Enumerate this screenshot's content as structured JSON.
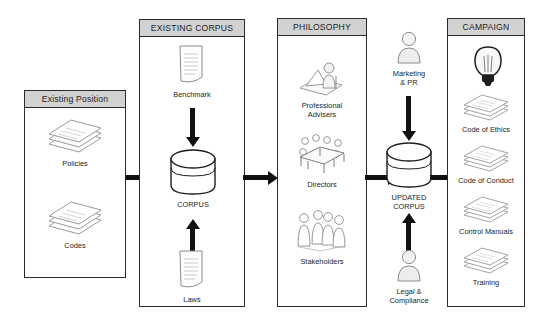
{
  "diagram": {
    "colors": {
      "header_fill": "#d2d2d2",
      "panel_border": "#2b2b2b",
      "arrow": "#111111",
      "icon_line": "#6e6e6e",
      "background": "#ffffff"
    }
  },
  "panels": [
    {
      "id": "existing-position",
      "title": "Existing Position",
      "items": [
        {
          "label": "Policies",
          "icon": "paper-stack-icon"
        },
        {
          "label": "Codes",
          "icon": "paper-stack-icon"
        }
      ]
    },
    {
      "id": "existing-corpus",
      "title": "EXISTING CORPUS",
      "items": [
        {
          "label": "Benchmark",
          "icon": "document-icon"
        },
        {
          "label": "CORPUS",
          "icon": "database-cylinder-icon"
        },
        {
          "label": "Laws",
          "icon": "document-icon"
        }
      ]
    },
    {
      "id": "philosophy",
      "title": "PHILOSOPHY",
      "items": [
        {
          "label": "Professional\nAdvisers",
          "icon": "advisers-icon"
        },
        {
          "label": "Directors",
          "icon": "boardroom-table-icon"
        },
        {
          "label": "Stakeholders",
          "icon": "people-group-icon"
        }
      ]
    },
    {
      "id": "campaign",
      "title": "CAMPAIGN",
      "items": [
        {
          "label": "",
          "icon": "lightbulb-icon"
        },
        {
          "label": "Code of Ethics",
          "icon": "paper-stack-icon"
        },
        {
          "label": "Code of Conduct",
          "icon": "paper-stack-icon"
        },
        {
          "label": "Control Manuals",
          "icon": "paper-stack-icon"
        },
        {
          "label": "Training",
          "icon": "paper-stack-icon"
        }
      ]
    }
  ],
  "between": {
    "updated_corpus": {
      "label": "UPDATED\nCORPUS",
      "icon": "database-cylinder-icon"
    },
    "marketing": {
      "label": "Marketing\n& PR",
      "icon": "person-icon"
    },
    "legal": {
      "label": "Legal &\nCompliance",
      "icon": "person-icon"
    }
  },
  "flow": {
    "arrow_position_to_corpus": "Existing Position → CORPUS",
    "arrow_corpus_to_philosophy": "CORPUS → right",
    "arrow_philosophy_to_updated": "PHILOSOPHY → UPDATED CORPUS",
    "arrow_updated_to_campaign": "UPDATED CORPUS → CAMPAIGN",
    "arrow_benchmark_down": "Benchmark ↓ CORPUS",
    "arrow_laws_up": "Laws ↑ CORPUS",
    "arrow_marketing_down": "Marketing & PR ↓ UPDATED CORPUS",
    "arrow_legal_up": "Legal & Compliance ↑ UPDATED CORPUS"
  }
}
